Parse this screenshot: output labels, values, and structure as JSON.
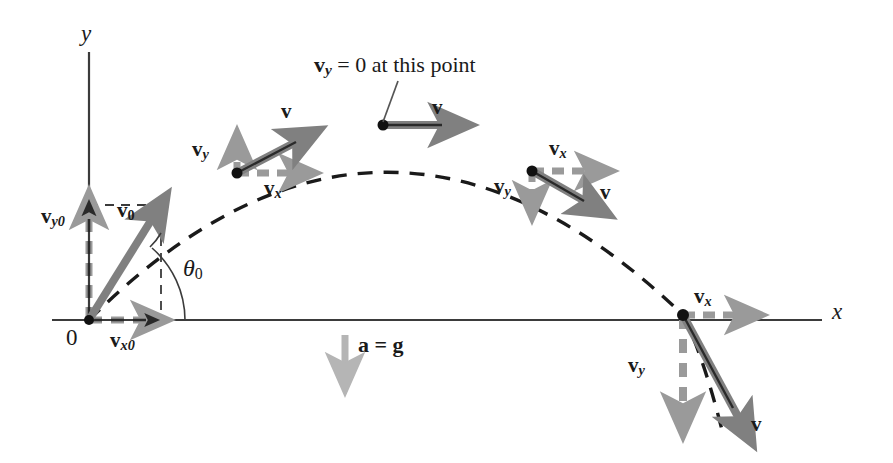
{
  "figure": {
    "colors": {
      "axis": "#3b3b3b",
      "trajectory": "#1a1a1a",
      "solid_vector": "#808080",
      "dashed_vector": "#9a9a9a",
      "accel_arrow": "#b5b5b5",
      "text": "#1a1a1a",
      "point": "#111111",
      "background": "#ffffff"
    },
    "axes": {
      "y_label": "y",
      "x_label": "x",
      "origin_label": "0"
    },
    "angle": {
      "label": "θ",
      "subscript": "0"
    },
    "acceleration": {
      "label": "a = g",
      "arrow_direction": "down"
    },
    "apex_note": {
      "vector": "v",
      "subscript": "y",
      "text": "= 0 at this point"
    },
    "labels": {
      "v": "v",
      "v0_sub": "0",
      "vx0_sub": "x0",
      "vy0_sub": "y0",
      "vx_sub": "x",
      "vy_sub": "y"
    },
    "points": [
      {
        "name": "launch-point",
        "x": 89,
        "y": 320
      },
      {
        "name": "ascending-point",
        "x": 237,
        "y": 173
      },
      {
        "name": "apex-point",
        "x": 383,
        "y": 125
      },
      {
        "name": "descending-point",
        "x": 532,
        "y": 171
      },
      {
        "name": "landing-point",
        "x": 683,
        "y": 315
      }
    ]
  }
}
